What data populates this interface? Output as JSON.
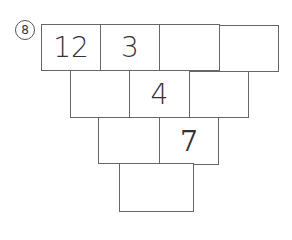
{
  "problem_label": "8",
  "rows": [
    [
      "12",
      "3",
      "",
      ""
    ],
    [
      "",
      "4",
      ""
    ],
    [
      "",
      "7"
    ],
    [
      ""
    ]
  ]
}
